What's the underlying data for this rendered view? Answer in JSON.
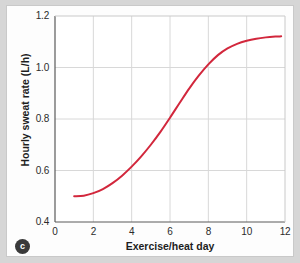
{
  "figure": {
    "panel_label": "c",
    "background_color": "#d6d6d6",
    "plot_background_color": "#ffffff",
    "frame_color": "#fdfdfd"
  },
  "chart_data": {
    "type": "line",
    "title": "",
    "subtitle": "",
    "xlabel": "Exercise/heat day",
    "ylabel": "Hourly sweat rate (L/h)",
    "xlim": [
      0,
      12
    ],
    "ylim": [
      0.4,
      1.2
    ],
    "xticks": [
      0,
      2,
      4,
      6,
      8,
      10,
      12
    ],
    "xtick_labels": [
      "0",
      "2",
      "4",
      "6",
      "8",
      "10",
      "12"
    ],
    "yticks": [
      0.4,
      0.6,
      0.8,
      1.0,
      1.2
    ],
    "ytick_labels": [
      "0.4",
      "0.6",
      "0.8",
      "1.0",
      "1.2"
    ],
    "grid": true,
    "grid_color": "#d8d8d8",
    "legend": null,
    "annotations": [],
    "series": [
      {
        "name": "Hourly sweat rate",
        "color": "#d2273c",
        "line_width": 2,
        "x": [
          1.0,
          1.5,
          2.0,
          2.5,
          3.0,
          3.5,
          4.0,
          4.5,
          5.0,
          5.5,
          6.0,
          6.5,
          7.0,
          7.5,
          8.0,
          8.5,
          9.0,
          9.5,
          10.0,
          10.5,
          11.0,
          11.5,
          11.8
        ],
        "values": [
          0.5,
          0.502,
          0.512,
          0.528,
          0.551,
          0.58,
          0.615,
          0.655,
          0.7,
          0.75,
          0.805,
          0.862,
          0.918,
          0.968,
          1.012,
          1.048,
          1.074,
          1.092,
          1.104,
          1.112,
          1.117,
          1.12,
          1.121
        ]
      }
    ]
  }
}
